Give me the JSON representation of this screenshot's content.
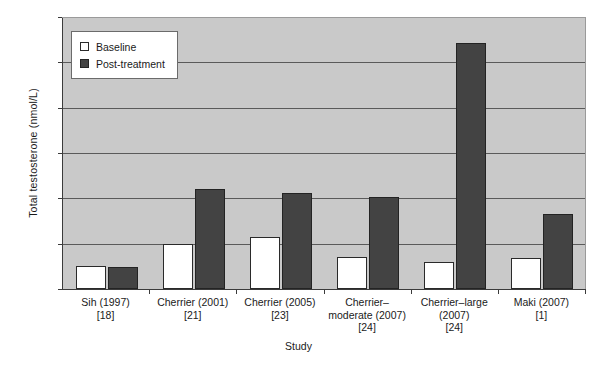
{
  "chart_data": {
    "type": "bar",
    "title": "",
    "xlabel": "Study",
    "ylabel": "Total testosterone (nmol/L)",
    "ylim": [
      0,
      120
    ],
    "yticks": [
      0,
      20,
      40,
      60,
      80,
      100,
      120
    ],
    "grid": true,
    "legend_position": "top-left",
    "categories": [
      "Sih (1997)\n[18]",
      "Cherrier (2001)\n[21]",
      "Cherrier (2005)\n[23]",
      "Cherrier–\nmoderate (2007)\n[24]",
      "Cherrier–large\n(2007)\n[24]",
      "Maki (2007)\n[1]"
    ],
    "series": [
      {
        "name": "Baseline",
        "color": "#ffffff",
        "values": [
          10,
          20,
          23,
          14,
          12,
          13.5
        ]
      },
      {
        "name": "Post-treatment",
        "color": "#434343",
        "values": [
          9.5,
          44,
          42.5,
          40.5,
          108.5,
          33
        ]
      }
    ]
  },
  "legend": {
    "items": [
      {
        "label": "Baseline"
      },
      {
        "label": "Post-treatment"
      }
    ]
  },
  "axes": {
    "y_title": "Total testosterone (nmol/L)",
    "x_title": "Study",
    "y_tick_labels": [
      "120",
      "100",
      "80",
      "60",
      "40",
      "20",
      "0"
    ]
  }
}
